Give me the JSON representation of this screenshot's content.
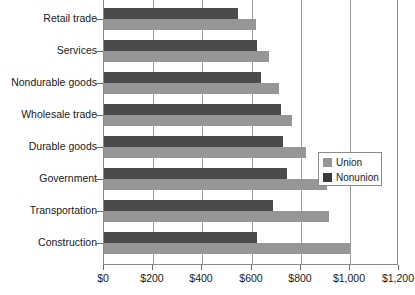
{
  "chart_data": {
    "type": "bar",
    "orientation": "horizontal",
    "title": "",
    "xlabel": "",
    "ylabel": "",
    "xlim": [
      0,
      1200
    ],
    "xticks": [
      0,
      200,
      400,
      600,
      800,
      1000,
      1200
    ],
    "xtick_labels": [
      "$0",
      "$200",
      "$400",
      "$600",
      "$800",
      "$1,000",
      "$1,200"
    ],
    "grid": true,
    "grid_axis": "x",
    "legend_position": "middle-right",
    "categories": [
      "Retail trade",
      "Services",
      "Nondurable goods",
      "Wholesale trade",
      "Durable goods",
      "Government",
      "Transportation",
      "Construction"
    ],
    "series": [
      {
        "name": "Union",
        "color": "#969696",
        "values": [
          619,
          673,
          713,
          764,
          822,
          908,
          916,
          1000
        ]
      },
      {
        "name": "Nonunion",
        "color": "#4b4b4b",
        "values": [
          546,
          624,
          638,
          719,
          730,
          746,
          689,
          624
        ]
      }
    ]
  },
  "legend": {
    "items": [
      {
        "label": "Union",
        "swatch": "union"
      },
      {
        "label": "Nonunion",
        "swatch": "nonunion"
      }
    ]
  }
}
